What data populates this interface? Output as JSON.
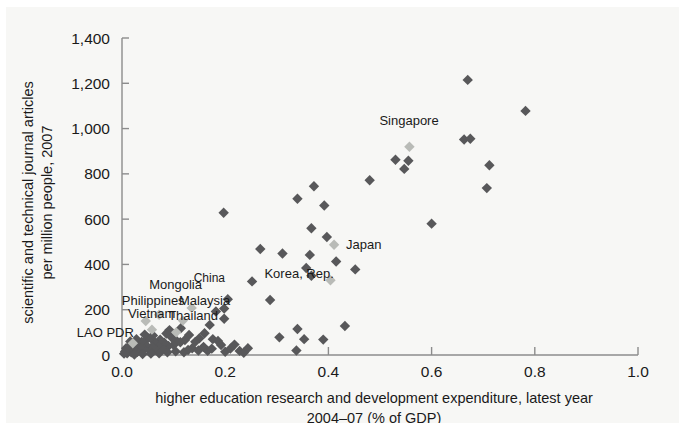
{
  "chart_data": {
    "type": "scatter",
    "title": "",
    "xlabel": "higher education research and development expenditure, latest year 2004–07 (% of GDP)",
    "xlabel_line1": "higher education research and development expenditure, latest year",
    "xlabel_line2": "2004–07 (% of GDP)",
    "ylabel": "scientific and technical journal articles per million people, 2007",
    "ylabel_line1": "scientific and technical journal articles",
    "ylabel_line2": "per million people, 2007",
    "xlim": [
      0.0,
      1.0
    ],
    "ylim": [
      0,
      1400
    ],
    "xticks": [
      "0.0",
      "0.2",
      "0.4",
      "0.6",
      "0.8",
      "1.0"
    ],
    "xtick_values": [
      0.0,
      0.2,
      0.4,
      0.6,
      0.8,
      1.0
    ],
    "yticks": [
      "0",
      "200",
      "400",
      "600",
      "800",
      "1,000",
      "1,200",
      "1,400"
    ],
    "ytick_values": [
      0,
      200,
      400,
      600,
      800,
      1000,
      1200,
      1400
    ],
    "grid": false,
    "legend": "none",
    "marker_shape": "diamond",
    "colors": {
      "marker": "#58585a",
      "marker_highlight": "#b9bbb7",
      "axis": "#8c8c8c",
      "text": "#1a1a1a",
      "background": "#f7f7f5"
    },
    "annotations": [
      {
        "label": "Singapore",
        "x": 0.557,
        "y": 920,
        "label_dx": -30,
        "label_dy": -22
      },
      {
        "label": "Japan",
        "x": 0.411,
        "y": 487,
        "label_dx": 12,
        "label_dy": 4
      },
      {
        "label": "Korea, Rep.",
        "x": 0.404,
        "y": 330,
        "label_dx": -66,
        "label_dy": -2
      },
      {
        "label": "Mongolia",
        "x": 0.072,
        "y": 178,
        "label_dx": -10,
        "label_dy": -26
      },
      {
        "label": "China",
        "x": 0.135,
        "y": 208,
        "label_dx": 2,
        "label_dy": -26
      },
      {
        "label": "Philippines",
        "x": 0.046,
        "y": 150,
        "label_dx": -24,
        "label_dy": -16
      },
      {
        "label": "Malaysia",
        "x": 0.118,
        "y": 152,
        "label_dx": -4,
        "label_dy": -16
      },
      {
        "label": "Vietnam",
        "x": 0.058,
        "y": 112,
        "label_dx": -24,
        "label_dy": -12
      },
      {
        "label": "Thailand",
        "x": 0.105,
        "y": 100,
        "label_dx": -8,
        "label_dy": -12
      },
      {
        "label": "LAO PDR",
        "x": 0.021,
        "y": 52,
        "label_dx": -56,
        "label_dy": -6
      }
    ],
    "highlighted_points": [
      {
        "name": "Singapore",
        "x": 0.557,
        "y": 920
      },
      {
        "name": "Japan",
        "x": 0.411,
        "y": 487
      },
      {
        "name": "Korea, Rep.",
        "x": 0.404,
        "y": 330
      },
      {
        "name": "Mongolia",
        "x": 0.072,
        "y": 178
      },
      {
        "name": "China",
        "x": 0.135,
        "y": 208
      },
      {
        "name": "Philippines",
        "x": 0.046,
        "y": 150
      },
      {
        "name": "Malaysia",
        "x": 0.118,
        "y": 152
      },
      {
        "name": "Vietnam",
        "x": 0.058,
        "y": 112
      },
      {
        "name": "Thailand",
        "x": 0.105,
        "y": 100
      },
      {
        "name": "LAO PDR",
        "x": 0.021,
        "y": 52
      }
    ],
    "points": [
      {
        "x": 0.67,
        "y": 1215
      },
      {
        "x": 0.782,
        "y": 1078
      },
      {
        "x": 0.663,
        "y": 952
      },
      {
        "x": 0.675,
        "y": 955
      },
      {
        "x": 0.53,
        "y": 862
      },
      {
        "x": 0.555,
        "y": 858
      },
      {
        "x": 0.547,
        "y": 822
      },
      {
        "x": 0.712,
        "y": 838
      },
      {
        "x": 0.707,
        "y": 737
      },
      {
        "x": 0.48,
        "y": 772
      },
      {
        "x": 0.372,
        "y": 745
      },
      {
        "x": 0.34,
        "y": 690
      },
      {
        "x": 0.392,
        "y": 660
      },
      {
        "x": 0.6,
        "y": 580
      },
      {
        "x": 0.197,
        "y": 628
      },
      {
        "x": 0.367,
        "y": 560
      },
      {
        "x": 0.268,
        "y": 468
      },
      {
        "x": 0.397,
        "y": 521
      },
      {
        "x": 0.311,
        "y": 448
      },
      {
        "x": 0.364,
        "y": 442
      },
      {
        "x": 0.415,
        "y": 413
      },
      {
        "x": 0.357,
        "y": 384
      },
      {
        "x": 0.452,
        "y": 378
      },
      {
        "x": 0.367,
        "y": 350
      },
      {
        "x": 0.252,
        "y": 325
      },
      {
        "x": 0.287,
        "y": 243
      },
      {
        "x": 0.205,
        "y": 246
      },
      {
        "x": 0.198,
        "y": 205
      },
      {
        "x": 0.198,
        "y": 160
      },
      {
        "x": 0.34,
        "y": 115
      },
      {
        "x": 0.432,
        "y": 128
      },
      {
        "x": 0.305,
        "y": 78
      },
      {
        "x": 0.353,
        "y": 70
      },
      {
        "x": 0.39,
        "y": 68
      },
      {
        "x": 0.338,
        "y": 20
      },
      {
        "x": 0.182,
        "y": 192
      },
      {
        "x": 0.17,
        "y": 133
      },
      {
        "x": 0.16,
        "y": 96
      },
      {
        "x": 0.176,
        "y": 70
      },
      {
        "x": 0.186,
        "y": 62
      },
      {
        "x": 0.192,
        "y": 44
      },
      {
        "x": 0.15,
        "y": 74
      },
      {
        "x": 0.142,
        "y": 58
      },
      {
        "x": 0.13,
        "y": 88
      },
      {
        "x": 0.122,
        "y": 66
      },
      {
        "x": 0.113,
        "y": 56
      },
      {
        "x": 0.106,
        "y": 62
      },
      {
        "x": 0.1,
        "y": 44
      },
      {
        "x": 0.096,
        "y": 78
      },
      {
        "x": 0.09,
        "y": 40
      },
      {
        "x": 0.086,
        "y": 95
      },
      {
        "x": 0.082,
        "y": 54
      },
      {
        "x": 0.078,
        "y": 30
      },
      {
        "x": 0.074,
        "y": 68
      },
      {
        "x": 0.07,
        "y": 42
      },
      {
        "x": 0.066,
        "y": 22
      },
      {
        "x": 0.062,
        "y": 60
      },
      {
        "x": 0.058,
        "y": 36
      },
      {
        "x": 0.054,
        "y": 18
      },
      {
        "x": 0.05,
        "y": 74
      },
      {
        "x": 0.046,
        "y": 44
      },
      {
        "x": 0.042,
        "y": 26
      },
      {
        "x": 0.038,
        "y": 58
      },
      {
        "x": 0.034,
        "y": 34
      },
      {
        "x": 0.03,
        "y": 14
      },
      {
        "x": 0.026,
        "y": 48
      },
      {
        "x": 0.022,
        "y": 28
      },
      {
        "x": 0.018,
        "y": 12
      },
      {
        "x": 0.014,
        "y": 38
      },
      {
        "x": 0.012,
        "y": 20
      },
      {
        "x": 0.01,
        "y": 8
      },
      {
        "x": 0.008,
        "y": 30
      },
      {
        "x": 0.006,
        "y": 16
      },
      {
        "x": 0.004,
        "y": 6
      },
      {
        "x": 0.016,
        "y": 60
      },
      {
        "x": 0.028,
        "y": 70
      },
      {
        "x": 0.044,
        "y": 90
      },
      {
        "x": 0.06,
        "y": 86
      },
      {
        "x": 0.092,
        "y": 110
      },
      {
        "x": 0.114,
        "y": 118
      },
      {
        "x": 0.136,
        "y": 30
      },
      {
        "x": 0.148,
        "y": 20
      },
      {
        "x": 0.158,
        "y": 36
      },
      {
        "x": 0.166,
        "y": 18
      },
      {
        "x": 0.174,
        "y": 28
      },
      {
        "x": 0.128,
        "y": 22
      },
      {
        "x": 0.12,
        "y": 12
      },
      {
        "x": 0.104,
        "y": 16
      },
      {
        "x": 0.088,
        "y": 12
      },
      {
        "x": 0.072,
        "y": 8
      },
      {
        "x": 0.056,
        "y": 6
      },
      {
        "x": 0.04,
        "y": 4
      },
      {
        "x": 0.024,
        "y": 2
      },
      {
        "x": 0.2,
        "y": 14
      },
      {
        "x": 0.21,
        "y": 28
      },
      {
        "x": 0.218,
        "y": 46
      },
      {
        "x": 0.228,
        "y": 18
      },
      {
        "x": 0.236,
        "y": 10
      },
      {
        "x": 0.244,
        "y": 30
      }
    ]
  }
}
